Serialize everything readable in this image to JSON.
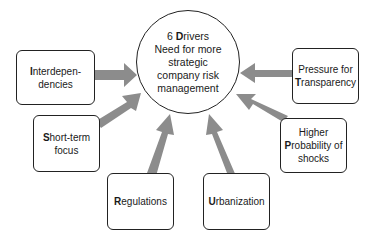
{
  "hub": {
    "line1_number": "6 ",
    "line1_initial": "D",
    "line1_rest": "rivers",
    "line2": "Need for more",
    "line3": "strategic",
    "line4": "company risk",
    "line5": "management"
  },
  "drivers": [
    {
      "initial": "I",
      "rest_line1": "nterdepen-",
      "line2": "dencies"
    },
    {
      "initial": "S",
      "rest_line1": "hort-term",
      "line2": "focus"
    },
    {
      "initial": "R",
      "rest_line1": "egulations"
    },
    {
      "initial": "U",
      "rest_line1": "rbanization"
    },
    {
      "line0": "Higher",
      "initial": "P",
      "rest_line1": "robability of",
      "line2": "shocks"
    },
    {
      "line0": "Pressure for",
      "initial": "T",
      "rest_line1": "ransparency"
    }
  ],
  "colors": {
    "arrow": "#8c8c8c",
    "border": "#222222",
    "background": "#ffffff"
  }
}
